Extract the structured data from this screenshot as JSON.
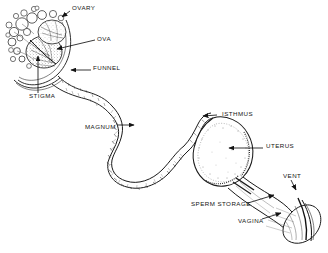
{
  "figure": {
    "kind": "anatomical-line-diagram",
    "background_color": "#ffffff",
    "ink_color": "#141414",
    "label_color": "#141414"
  },
  "labels": [
    {
      "id": "ovary",
      "text": "OVARY",
      "x": 72,
      "y": 8,
      "anchor": "start"
    },
    {
      "id": "ova",
      "text": "OVA",
      "x": 97,
      "y": 39,
      "anchor": "start"
    },
    {
      "id": "funnel",
      "text": "FUNNEL",
      "x": 93,
      "y": 68,
      "anchor": "start"
    },
    {
      "id": "stigma",
      "text": "STIGMA",
      "x": 29,
      "y": 95,
      "anchor": "start"
    },
    {
      "id": "magnum",
      "text": "MAGNUM",
      "x": 85,
      "y": 127,
      "anchor": "start"
    },
    {
      "id": "isthmus",
      "text": "ISTHMUS",
      "x": 219,
      "y": 114,
      "anchor": "start"
    },
    {
      "id": "uterus",
      "text": "UTERUS",
      "x": 265,
      "y": 146,
      "anchor": "start"
    },
    {
      "id": "vent",
      "text": "VENT",
      "x": 283,
      "y": 176,
      "anchor": "start"
    },
    {
      "id": "sperm-storage",
      "text": "SPERM STORAGE",
      "x": 191,
      "y": 204,
      "anchor": "start"
    },
    {
      "id": "vagina",
      "text": "VAGINA",
      "x": 238,
      "y": 221,
      "anchor": "start"
    }
  ],
  "leader_lines": [
    {
      "id": "ovary-leader",
      "from_label": "OVARY",
      "points": "69,11 62,16",
      "arrow_at": "62,16",
      "arrow_angle": 215
    },
    {
      "id": "ova-leader",
      "from_label": "OVA",
      "points": "95,40 56,48",
      "arrow_at": "56,48",
      "arrow_angle": 190
    },
    {
      "id": "funnel-leader",
      "from_label": "FUNNEL",
      "points": "91,70 70,70",
      "arrow_at": "70,70",
      "arrow_angle": 180
    },
    {
      "id": "stigma-leader",
      "from_label": "STIGMA",
      "points": "38,93 38,55",
      "arrow_at": "38,55",
      "arrow_angle": 270
    },
    {
      "id": "magnum-leader",
      "from_label": "MAGNUM",
      "points": "117,125 134,125",
      "arrow_at": "134,125",
      "arrow_angle": 0
    },
    {
      "id": "isthmus-leader",
      "from_label": "ISTHMUS",
      "points": "217,115 202,115",
      "arrow_at": "202,115",
      "arrow_angle": 180
    },
    {
      "id": "uterus-leader",
      "from_label": "UTERUS",
      "points": "263,148 228,148",
      "arrow_at": "228,148",
      "arrow_angle": 180
    },
    {
      "id": "vent-leader",
      "from_label": "VENT",
      "points": "291,180 296,189",
      "arrow_at": "296,189",
      "arrow_angle": 60
    },
    {
      "id": "sperm-storage-leader",
      "from_label": "SPERM STORAGE",
      "points": "248,203 274,195",
      "arrow_at": "274,195",
      "arrow_angle": 340
    },
    {
      "id": "vagina-leader",
      "from_label": "VAGINA",
      "points": "262,219 281,213",
      "arrow_at": "281,213",
      "arrow_angle": 342
    }
  ],
  "structures": [
    {
      "id": "ovary-follicle-cluster",
      "name": "ovary with ova follicles",
      "region": "top-left"
    },
    {
      "id": "infundibulum-funnel",
      "name": "funnel / infundibulum",
      "region": "upper-left"
    },
    {
      "id": "magnum-coil",
      "name": "magnum coiled tube",
      "region": "center"
    },
    {
      "id": "isthmus-segment",
      "name": "isthmus",
      "region": "center-right"
    },
    {
      "id": "uterus-shell-gland",
      "name": "uterus / shell gland",
      "region": "right"
    },
    {
      "id": "vagina-segment",
      "name": "vagina",
      "region": "lower-right"
    },
    {
      "id": "vent-opening",
      "name": "vent / cloaca",
      "region": "far-right"
    }
  ]
}
